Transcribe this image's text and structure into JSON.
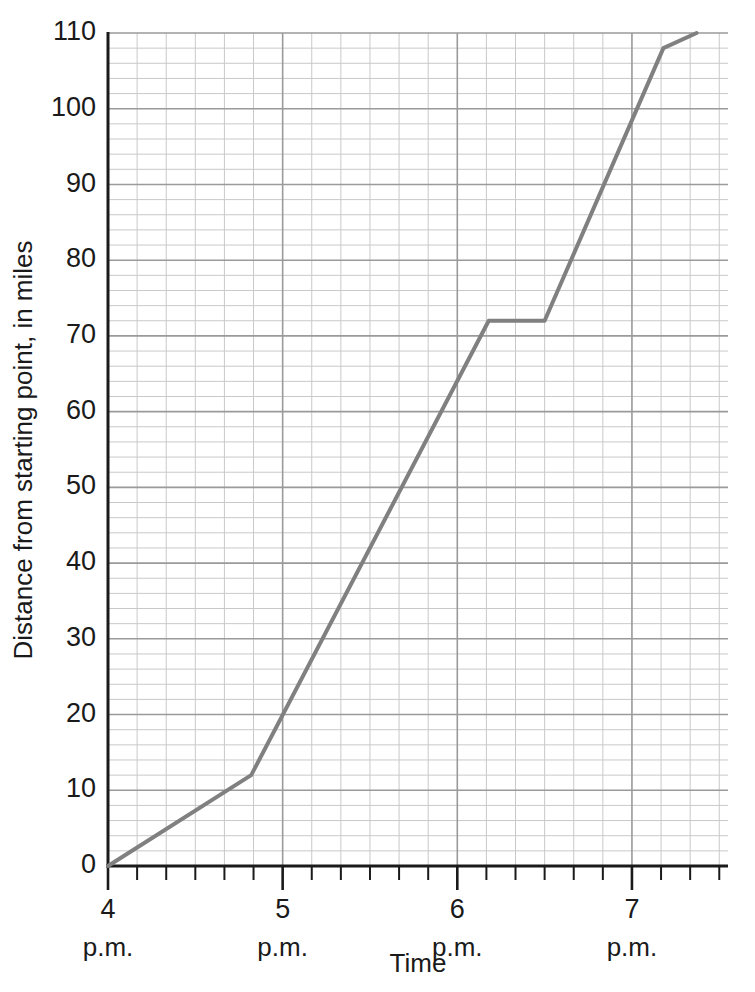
{
  "chart_data": {
    "type": "line",
    "title": "",
    "subtitle": "",
    "xlabel": "Time",
    "ylabel": "Distance from starting point, in miles",
    "xlim": [
      4.0,
      7.55
    ],
    "ylim": [
      0,
      110
    ],
    "grid": true,
    "legend": false,
    "legend_position": "none",
    "x_major_ticks": [
      4,
      5,
      6,
      7
    ],
    "x_major_tick_labels": [
      "4",
      "5",
      "6",
      "7"
    ],
    "x_major_tick_sublabels": [
      "p.m.",
      "p.m.",
      "p.m.",
      "p.m."
    ],
    "x_minor_tick_step_hours": 0.16666667,
    "y_major_ticks": [
      0,
      10,
      20,
      30,
      40,
      50,
      60,
      70,
      80,
      90,
      100,
      110
    ],
    "y_major_tick_labels": [
      "0",
      "10",
      "20",
      "30",
      "40",
      "50",
      "60",
      "70",
      "80",
      "90",
      "100",
      "110"
    ],
    "y_minor_tick_step": 2,
    "series": [
      {
        "name": "Distance traveled",
        "color": "#808080",
        "x": [
          4.0,
          4.82,
          6.18,
          6.5,
          7.18,
          7.37
        ],
        "y": [
          0,
          12,
          72,
          72,
          108,
          110
        ],
        "x_time_labels": [
          "4:00 p.m.",
          "4:49 p.m.",
          "6:11 p.m.",
          "6:30 p.m.",
          "7:11 p.m.",
          "7:22 p.m."
        ]
      }
    ],
    "annotations": []
  },
  "colors": {
    "line": "#808080",
    "minor_grid": "#c9c9c9",
    "major_grid": "#9a9a9a",
    "axis": "#1a1a1a",
    "background": "#ffffff",
    "text": "#1a1a1a"
  },
  "axis_titles": {
    "x": "Time",
    "y": "Distance from starting point, in miles"
  }
}
